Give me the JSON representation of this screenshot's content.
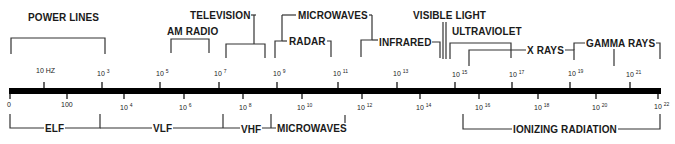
{
  "axis": {
    "upper_ticks": [
      {
        "text": "10 HZ",
        "x": 44
      },
      {
        "base": "10",
        "exp": "3",
        "x": 103
      },
      {
        "base": "10",
        "exp": "5",
        "x": 160
      },
      {
        "base": "10",
        "exp": "7",
        "x": 219
      },
      {
        "base": "10",
        "exp": "9",
        "x": 277
      },
      {
        "base": "10",
        "exp": "11",
        "x": 338
      },
      {
        "base": "10",
        "exp": "13",
        "x": 397
      },
      {
        "base": "10",
        "exp": "15",
        "x": 455
      },
      {
        "base": "10",
        "exp": "17",
        "x": 512
      },
      {
        "base": "10",
        "exp": "19",
        "x": 570
      },
      {
        "base": "10",
        "exp": "21",
        "x": 630
      }
    ],
    "lower_ticks": [
      {
        "text": "0",
        "x": 10
      },
      {
        "text": "100",
        "x": 67
      },
      {
        "base": "10",
        "exp": "4",
        "x": 124
      },
      {
        "base": "10",
        "exp": "6",
        "x": 184
      },
      {
        "base": "10",
        "exp": "8",
        "x": 243
      },
      {
        "base": "10",
        "exp": "10",
        "x": 302
      },
      {
        "base": "10",
        "exp": "12",
        "x": 362
      },
      {
        "base": "10",
        "exp": "14",
        "x": 420
      },
      {
        "base": "10",
        "exp": "16",
        "x": 479
      },
      {
        "base": "10",
        "exp": "18",
        "x": 538
      },
      {
        "base": "10",
        "exp": "20",
        "x": 596
      },
      {
        "base": "10",
        "exp": "22",
        "x": 658
      }
    ]
  },
  "upper_bands": {
    "power_lines": "POWER LINES",
    "am_radio": "AM RADIO",
    "television": "TELEVISION",
    "microwaves": "MICROWAVES",
    "radar": "RADAR",
    "infrared": "INFRARED",
    "visible_light": "VISIBLE LIGHT",
    "ultraviolet": "ULTRAVIOLET",
    "x_rays": "X RAYS",
    "gamma_rays": "GAMMA RAYS"
  },
  "lower_bands": {
    "elf": "ELF",
    "vlf": "VLF",
    "vhf": "VHF",
    "microwaves": "MICROWAVES",
    "ionizing_radiation": "IONIZING RADIATION"
  }
}
